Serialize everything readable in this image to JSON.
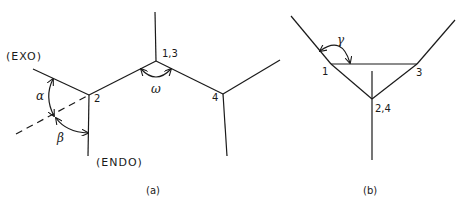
{
  "panel_a": {
    "caption": "(a)",
    "labels": {
      "exo": "(EXO)",
      "endo": "(ENDO)",
      "vertex_2": "2",
      "vertex_13": "1,3",
      "vertex_4": "4"
    },
    "angles": {
      "alpha": "α",
      "beta": "β",
      "omega": "ω"
    }
  },
  "panel_b": {
    "caption": "(b)",
    "labels": {
      "vertex_1": "1",
      "vertex_3": "3",
      "vertex_24": "2,4"
    },
    "angles": {
      "gamma": "γ"
    }
  },
  "colors": {
    "line": "#1a1a1a",
    "background": "#ffffff"
  }
}
